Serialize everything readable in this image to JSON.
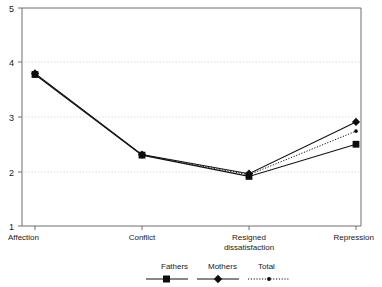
{
  "chart_data": {
    "type": "line",
    "title": "",
    "xlabel": "",
    "ylabel": "",
    "ylim": [
      1,
      5
    ],
    "yticks": [
      1,
      2,
      3,
      4,
      5
    ],
    "ytick_labels": [
      "1",
      "2",
      "3",
      "4",
      "5"
    ],
    "grid": true,
    "grid_axis": "y",
    "legend_position": "bottom",
    "categories": [
      "Affection",
      "Resigned\ndissatisfaction",
      "Conflict",
      "Repression"
    ],
    "category_labels": {
      "affection": "Affection",
      "conflict": "Conflict",
      "resigned_line1": "Resigned",
      "resigned_line2": "dissatisfaction",
      "repression": "Repression"
    },
    "series": [
      {
        "name": "Fathers",
        "marker": "square",
        "line_style": "solid",
        "color": "#0d0d0d",
        "values": [
          3.78,
          2.3,
          1.91,
          2.5
        ]
      },
      {
        "name": "Mothers",
        "marker": "diamond",
        "line_style": "solid",
        "color": "#0d0d0d",
        "values": [
          3.8,
          2.31,
          1.96,
          2.91
        ]
      },
      {
        "name": "Total",
        "marker": "dot",
        "line_style": "dotted",
        "color": "#0d0d0d",
        "values": [
          3.79,
          2.3,
          1.94,
          2.74
        ]
      }
    ],
    "legend_entries": [
      {
        "label": "Fathers",
        "marker": "square",
        "line_style": "solid"
      },
      {
        "label": "Mothers",
        "marker": "diamond",
        "line_style": "solid"
      },
      {
        "label": "Total",
        "marker": "dot",
        "line_style": "dotted"
      }
    ]
  },
  "axis": {
    "y_tick_5": "5",
    "y_tick_4": "4",
    "y_tick_3": "3",
    "y_tick_2": "2",
    "y_tick_1": "1"
  },
  "legend": {
    "fathers": "Fathers",
    "mothers": "Mothers",
    "total": "Total"
  },
  "colors": {
    "ink": "#0d0d0d",
    "axis": "#6e6e6e",
    "grid": "#c9c9c9",
    "background": "#ffffff"
  }
}
